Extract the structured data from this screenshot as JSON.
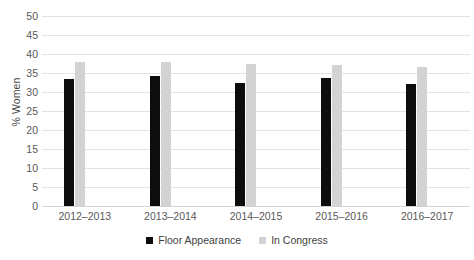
{
  "chart_data": {
    "type": "bar",
    "title": "",
    "xlabel": "",
    "ylabel": "% Women",
    "ylim": [
      0,
      50
    ],
    "yticks": [
      0,
      5,
      10,
      15,
      20,
      25,
      30,
      35,
      40,
      45,
      50
    ],
    "ytick_labels": [
      "0",
      "5",
      "10",
      "15",
      "20",
      "25",
      "30",
      "35",
      "40",
      "45",
      "50"
    ],
    "grid": true,
    "legend_position": "bottom-center",
    "categories": [
      "2012–2013",
      "2013–2014",
      "2014–2015",
      "2015–2016",
      "2016–2017"
    ],
    "series": [
      {
        "name": "Floor Appearance",
        "color": "#0d0d0d",
        "values": [
          33.5,
          34.2,
          32.5,
          33.6,
          32.0
        ]
      },
      {
        "name": "In Congress",
        "color": "#d3d3d3",
        "values": [
          37.8,
          37.8,
          37.5,
          37.0,
          36.5
        ]
      }
    ]
  }
}
